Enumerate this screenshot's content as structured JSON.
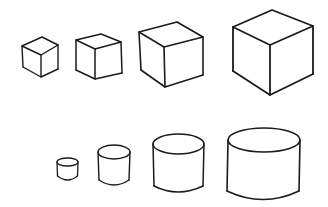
{
  "scene": {
    "description": "Hand-drawn sketch of four cubes increasing in size (top row) and four cylinders increasing in size (bottom row)",
    "stroke_color": "#1a1a1a",
    "background": "#ffffff"
  },
  "cubes": [
    {
      "label": "cube-1",
      "size": "smallest"
    },
    {
      "label": "cube-2",
      "size": "small"
    },
    {
      "label": "cube-3",
      "size": "medium"
    },
    {
      "label": "cube-4",
      "size": "largest"
    }
  ],
  "cylinders": [
    {
      "label": "cylinder-1",
      "size": "smallest"
    },
    {
      "label": "cylinder-2",
      "size": "small"
    },
    {
      "label": "cylinder-3",
      "size": "medium"
    },
    {
      "label": "cylinder-4",
      "size": "largest"
    }
  ]
}
